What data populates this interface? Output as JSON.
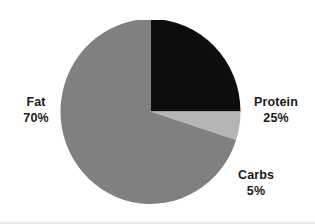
{
  "chart_data": {
    "type": "pie",
    "title": "",
    "subtitle": "",
    "xlabel": "",
    "ylabel": "",
    "legend_position": "none",
    "grid": false,
    "units": "percent",
    "background_color": "#ffffff",
    "categories": [
      "Protein",
      "Carbs",
      "Fat"
    ],
    "values": [
      25,
      5,
      70
    ],
    "colors": [
      "#0d0d0d",
      "#b5b5b5",
      "#808080"
    ],
    "start_angle_deg": 0,
    "direction": "clockwise",
    "slices": [
      {
        "label": "Protein",
        "value": 25,
        "value_text": "25%",
        "color": "#0d0d0d",
        "start_deg": 0,
        "end_deg": 90
      },
      {
        "label": "Carbs",
        "value": 5,
        "value_text": "5%",
        "color": "#b5b5b5",
        "start_deg": 90,
        "end_deg": 108
      },
      {
        "label": "Fat",
        "value": 70,
        "value_text": "70%",
        "color": "#808080",
        "start_deg": 108,
        "end_deg": 360
      }
    ]
  },
  "labels": {
    "fat": {
      "name": "Fat",
      "value": "70%"
    },
    "protein": {
      "name": "Protein",
      "value": "25%"
    },
    "carbs": {
      "name": "Carbs",
      "value": "5%"
    }
  }
}
